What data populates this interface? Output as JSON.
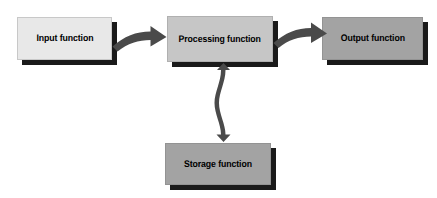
{
  "diagram": {
    "background_color": "#ffffff",
    "nodes": [
      {
        "id": "input",
        "label": "Input function",
        "fill_color": "#e8e8e8",
        "text_color": "#000000",
        "x": 17,
        "y": 17,
        "width": 95,
        "height": 43
      },
      {
        "id": "processing",
        "label": "Processing function",
        "fill_color": "#c6c6c6",
        "text_color": "#000000",
        "x": 167,
        "y": 16,
        "width": 106,
        "height": 46
      },
      {
        "id": "output",
        "label": "Output function",
        "fill_color": "#a3a3a3",
        "text_color": "#000000",
        "x": 322,
        "y": 17,
        "width": 101,
        "height": 43
      },
      {
        "id": "storage",
        "label": "Storage function",
        "fill_color": "#a3a3a3",
        "text_color": "#000000",
        "x": 165,
        "y": 143,
        "width": 106,
        "height": 42
      }
    ],
    "connectors": [
      {
        "id": "input-to-processing",
        "from": "input",
        "to": "processing",
        "style": "curved",
        "direction": "single",
        "color": "#4a4a4a"
      },
      {
        "id": "processing-to-output",
        "from": "processing",
        "to": "output",
        "style": "curved",
        "direction": "single",
        "color": "#4a4a4a"
      },
      {
        "id": "processing-storage",
        "from": "processing",
        "to": "storage",
        "style": "curved",
        "direction": "double",
        "color": "#4a4a4a"
      }
    ]
  }
}
